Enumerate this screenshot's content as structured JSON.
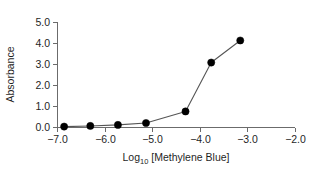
{
  "chart_data": {
    "type": "line",
    "title": "",
    "subtitle": "",
    "xlabel": "Log10 [Methylene Blue]",
    "xlabel_base": "Log",
    "xlabel_sub": "10",
    "xlabel_rest": " [Methylene Blue]",
    "ylabel": "Absorbance",
    "xlim": [
      -7.0,
      -2.0
    ],
    "ylim": [
      0.0,
      5.0
    ],
    "xticks": [
      -7.0,
      -6.0,
      -5.0,
      -4.0,
      -3.0,
      -2.0
    ],
    "xtick_labels": [
      "−7.0",
      "−6.0",
      "−5.0",
      "−4.0",
      "−3.0",
      "−2.0"
    ],
    "yticks": [
      0.0,
      1.0,
      2.0,
      3.0,
      4.0,
      5.0
    ],
    "ytick_labels": [
      "0.0",
      "1.0",
      "2.0",
      "3.0",
      "4.0",
      "5.0"
    ],
    "grid": false,
    "legend": false,
    "legend_position": "none",
    "marker": "filled-circle",
    "marker_color": "#000000",
    "line_color": "#555555",
    "axis_color": "#6b6b6b",
    "background_color": "#ffffff",
    "series": [
      {
        "name": "Absorbance",
        "x": [
          -6.85,
          -6.3,
          -5.72,
          -5.13,
          -4.3,
          -3.76,
          -3.15
        ],
        "y": [
          0.02,
          0.05,
          0.1,
          0.19,
          0.74,
          3.07,
          4.12
        ]
      }
    ]
  },
  "figure": {
    "width": 321,
    "height": 171
  }
}
